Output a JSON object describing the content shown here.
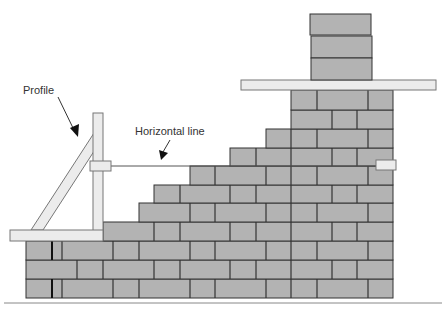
{
  "diagram": {
    "labels": {
      "profile": "Profile",
      "horizontal_line": "Horizontal line"
    },
    "colors": {
      "brick": "#b3b3b3",
      "joint": "#333333",
      "board": "#ececec",
      "ground": "#888888"
    },
    "parts": [
      "profile-post",
      "profile-brace",
      "profile-base-board",
      "line-clamp-left",
      "line-peg-right",
      "horizontal-line",
      "stepped-brick-wall",
      "corner-pier",
      "pier-board",
      "chimney-blocks",
      "ground-line"
    ]
  }
}
